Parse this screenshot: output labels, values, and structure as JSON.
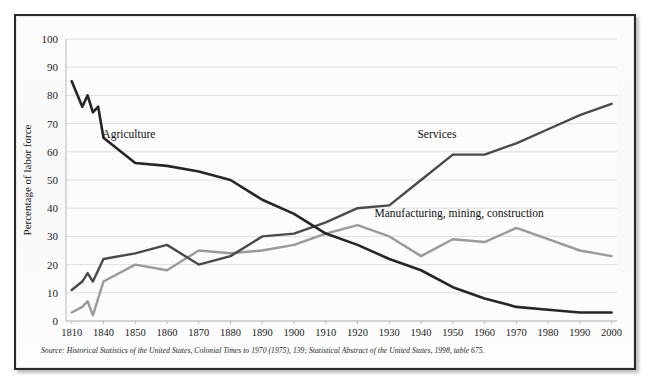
{
  "figure": {
    "source_note": "Source: Historical Statistics of the United States, Colonial Times to 1970 (1975), 139; Statistical Abstract of the United States, 1998, table 675.",
    "frame_color": "#2a2a2a",
    "background_color": "#fbfbfb"
  },
  "chart_data": {
    "type": "line",
    "title": "",
    "subtitle": "",
    "xlabel": "",
    "ylabel": "Percentage of labor force",
    "ylim": [
      0,
      100
    ],
    "ytick_labels": [
      "0",
      "10",
      "20",
      "30",
      "40",
      "50",
      "60",
      "70",
      "80",
      "90",
      "100"
    ],
    "ytick_values": [
      0,
      10,
      20,
      30,
      40,
      50,
      60,
      70,
      80,
      90,
      100
    ],
    "grid": true,
    "grid_axis": "y",
    "legend_position": "inline-labels",
    "x_tick_labels": [
      "1810",
      "1840",
      "1850",
      "1860",
      "1870",
      "1880",
      "1890",
      "1900",
      "1910",
      "1920",
      "1930",
      "1940",
      "1950",
      "1960",
      "1970",
      "1980",
      "1990",
      "2000"
    ],
    "x_tick_values": [
      1810,
      1840,
      1850,
      1860,
      1870,
      1880,
      1890,
      1900,
      1910,
      1920,
      1930,
      1940,
      1950,
      1960,
      1970,
      1980,
      1990,
      2000
    ],
    "x_axis_note": "categorical spacing: 1810 then decades 1840-2000 evenly spaced",
    "series": [
      {
        "name": "Agriculture",
        "color": "#262626",
        "stroke_width": 2.6,
        "label": "Agriculture",
        "label_x": 1848,
        "label_y": 65,
        "x": [
          1810,
          1820,
          1825,
          1830,
          1835,
          1840,
          1850,
          1860,
          1870,
          1880,
          1890,
          1900,
          1910,
          1920,
          1930,
          1940,
          1950,
          1960,
          1970,
          1980,
          1990,
          2000
        ],
        "values": [
          85,
          76,
          80,
          74,
          76,
          65,
          56,
          55,
          53,
          50,
          43,
          38,
          31,
          27,
          22,
          18,
          12,
          8,
          5,
          4,
          3,
          3
        ]
      },
      {
        "name": "Services",
        "color": "#4a4a4a",
        "stroke_width": 2.4,
        "label": "Services",
        "label_x": 1945,
        "label_y": 65,
        "x": [
          1810,
          1820,
          1825,
          1830,
          1835,
          1840,
          1850,
          1860,
          1870,
          1880,
          1890,
          1900,
          1910,
          1920,
          1930,
          1940,
          1950,
          1960,
          1970,
          1980,
          1990,
          2000
        ],
        "values": [
          11,
          14,
          17,
          14,
          18,
          22,
          24,
          27,
          20,
          23,
          30,
          31,
          35,
          40,
          41,
          50,
          59,
          59,
          63,
          68,
          73,
          77
        ]
      },
      {
        "name": "Manufacturing, mining, construction",
        "color": "#9a9a9a",
        "stroke_width": 2.4,
        "label": "Manufacturing, mining, construction",
        "label_x": 1952,
        "label_y": 37,
        "x": [
          1810,
          1820,
          1825,
          1830,
          1835,
          1840,
          1850,
          1860,
          1870,
          1880,
          1890,
          1900,
          1910,
          1920,
          1930,
          1940,
          1950,
          1960,
          1970,
          1980,
          1990,
          2000
        ],
        "values": [
          3,
          5,
          7,
          2,
          8,
          14,
          20,
          18,
          25,
          24,
          25,
          27,
          31,
          34,
          30,
          23,
          29,
          28,
          33,
          29,
          25,
          23
        ]
      }
    ]
  }
}
